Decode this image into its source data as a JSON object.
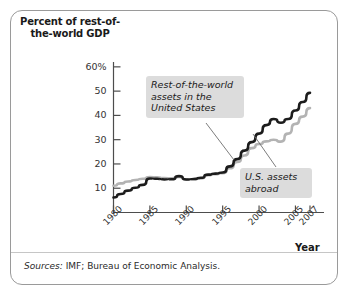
{
  "figure": {
    "sources_label": "Sources:",
    "sources_text": " IMF; Bureau of Economic Analysis."
  },
  "colors": {
    "series_black": "#1c1c1c",
    "series_gray": "#b3b3b3",
    "axis": "#4d4d4d",
    "callout_bg": "#dcdcdc",
    "frame": "#9a9a9a"
  },
  "chart_data": {
    "type": "line",
    "title": "",
    "ylabel": "Percent of rest-of-the-world GDP",
    "xlabel": "Year",
    "xlim": [
      1980,
      2007
    ],
    "ylim": [
      0,
      62
    ],
    "grid": false,
    "legend": "annotations",
    "y_ticks": [
      "60%",
      "50",
      "40",
      "30",
      "20",
      "10"
    ],
    "y_tick_values": [
      60,
      50,
      40,
      30,
      20,
      10
    ],
    "x_ticks": [
      "1980",
      "1985",
      "1990",
      "1995",
      "2000",
      "2005",
      "2007"
    ],
    "x_tick_values": [
      1980,
      1985,
      1990,
      1995,
      2000,
      2005,
      2007
    ],
    "x": [
      1980,
      1981,
      1982,
      1983,
      1984,
      1985,
      1986,
      1987,
      1988,
      1989,
      1990,
      1991,
      1992,
      1993,
      1994,
      1995,
      1996,
      1997,
      1998,
      1999,
      2000,
      2001,
      2002,
      2003,
      2004,
      2005,
      2006,
      2007
    ],
    "series": [
      {
        "name": "Rest-of-the-world assets in the United States",
        "color": "#1c1c1c",
        "values": [
          6.2,
          7.6,
          9.0,
          10.2,
          11.4,
          14.0,
          13.9,
          13.6,
          13.7,
          15.0,
          13.6,
          13.8,
          14.3,
          15.6,
          16.0,
          16.5,
          19.0,
          22.0,
          25.5,
          29.0,
          32.5,
          36.0,
          38.5,
          37.0,
          38.5,
          42.0,
          45.5,
          49.3
        ]
      },
      {
        "name": "U.S. assets abroad",
        "color": "#b3b3b3",
        "values": [
          11.0,
          12.0,
          12.8,
          13.4,
          13.9,
          14.6,
          14.5,
          14.2,
          14.1,
          14.6,
          13.6,
          13.7,
          14.0,
          15.4,
          15.8,
          16.2,
          18.2,
          20.8,
          23.5,
          26.5,
          28.2,
          29.3,
          30.0,
          29.2,
          32.5,
          36.5,
          39.5,
          43.0
        ]
      }
    ],
    "annotations": [
      {
        "id": "row-assets",
        "text": "Rest-of-the-world\nassets in the\nUnited States"
      },
      {
        "id": "us-assets",
        "text": "U.S. assets\nabroad"
      }
    ]
  }
}
